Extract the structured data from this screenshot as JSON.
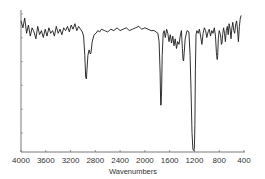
{
  "chart_data": {
    "type": "line",
    "title": "",
    "xlabel": "Wavenumbers",
    "ylabel": "",
    "xlim": [
      4000,
      400
    ],
    "x_reversed": true,
    "ylim": [
      0,
      100
    ],
    "grid": false,
    "legend": null,
    "x_ticks": [
      4000,
      3600,
      3200,
      2800,
      2400,
      2000,
      1600,
      1200,
      800,
      400
    ],
    "x_tick_labels": [
      "4000",
      "3600",
      "3200",
      "2800",
      "2400",
      "2000",
      "1600",
      "1200",
      "800",
      "400"
    ],
    "y_tick_count": 6,
    "y_tick_labels_visible": false,
    "series": [
      {
        "name": "IR spectrum",
        "color": "#1a1a1a",
        "x": [
          4000,
          3970,
          3940,
          3910,
          3880,
          3850,
          3820,
          3790,
          3760,
          3730,
          3700,
          3670,
          3640,
          3610,
          3580,
          3550,
          3520,
          3490,
          3460,
          3430,
          3400,
          3370,
          3340,
          3310,
          3280,
          3250,
          3220,
          3190,
          3160,
          3130,
          3100,
          3070,
          3040,
          3010,
          2990,
          2970,
          2955,
          2945,
          2935,
          2920,
          2900,
          2880,
          2870,
          2850,
          2820,
          2790,
          2760,
          2730,
          2700,
          2650,
          2600,
          2550,
          2500,
          2450,
          2400,
          2350,
          2300,
          2250,
          2200,
          2150,
          2100,
          2050,
          2000,
          1950,
          1900,
          1850,
          1820,
          1790,
          1770,
          1755,
          1745,
          1738,
          1730,
          1720,
          1705,
          1690,
          1670,
          1650,
          1630,
          1610,
          1590,
          1570,
          1550,
          1530,
          1510,
          1490,
          1470,
          1450,
          1430,
          1410,
          1395,
          1385,
          1375,
          1365,
          1350,
          1320,
          1290,
          1270,
          1255,
          1240,
          1225,
          1210,
          1200,
          1192,
          1185,
          1175,
          1160,
          1140,
          1120,
          1100,
          1080,
          1060,
          1040,
          1020,
          1000,
          980,
          960,
          940,
          920,
          900,
          880,
          860,
          845,
          832,
          825,
          815,
          800,
          780,
          765,
          755,
          745,
          730,
          715,
          700,
          685,
          670,
          655,
          640,
          625,
          610,
          595,
          580,
          565,
          550,
          535,
          520,
          505,
          490,
          475,
          460,
          445,
          430,
          420
        ],
        "transmittance": [
          95,
          90,
          97,
          86,
          92,
          84,
          90,
          87,
          82,
          91,
          85,
          88,
          83,
          89,
          84,
          90,
          86,
          88,
          84,
          91,
          86,
          89,
          85,
          90,
          88,
          91,
          87,
          92,
          89,
          93,
          88,
          91,
          89,
          87,
          84,
          70,
          54,
          53,
          60,
          70,
          74,
          71,
          72,
          80,
          85,
          86,
          88,
          87,
          89,
          88,
          87,
          89,
          88,
          90,
          88,
          89,
          90,
          88,
          89,
          90,
          91,
          89,
          90,
          89,
          88,
          88,
          87,
          86,
          80,
          58,
          34,
          34,
          45,
          70,
          86,
          88,
          83,
          89,
          86,
          80,
          85,
          79,
          84,
          77,
          82,
          75,
          80,
          78,
          84,
          88,
          75,
          67,
          66,
          72,
          82,
          88,
          87,
          70,
          45,
          14,
          2,
          1,
          3,
          20,
          60,
          85,
          88,
          86,
          89,
          84,
          78,
          86,
          90,
          88,
          83,
          87,
          89,
          84,
          88,
          86,
          90,
          84,
          72,
          67,
          70,
          82,
          88,
          85,
          78,
          79,
          85,
          90,
          86,
          80,
          88,
          91,
          85,
          93,
          89,
          82,
          90,
          94,
          88,
          86,
          92,
          95,
          89,
          80,
          91,
          97,
          99
        ]
      }
    ],
    "notable_peaks_cm-1": [
      2950,
      1740,
      1380,
      1240,
      1190,
      830
    ]
  }
}
